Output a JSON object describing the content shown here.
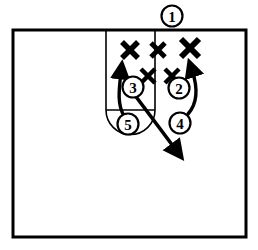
{
  "diagram": {
    "type": "half-court-play",
    "ink_color": "#000000",
    "court_color": "#ffffff",
    "court": {
      "name": "half-court",
      "outer": {
        "x": 13,
        "y": 30,
        "w": 233,
        "h": 207
      },
      "lane": {
        "left_x": 106,
        "right_x": 155,
        "top_y": 30,
        "bottom_y": 110
      },
      "free_throw_line": {
        "x1": 106,
        "y1": 110,
        "x2": 155,
        "y2": 110
      },
      "free_throw_circle": {
        "cx": 130,
        "cy": 110,
        "r": 25,
        "half": "lower"
      }
    },
    "defenders": [
      {
        "name": "defender-x-1",
        "mark": "X",
        "x": 130,
        "y": 50,
        "size": 20
      },
      {
        "name": "defender-x-2",
        "mark": "X",
        "x": 158,
        "y": 50,
        "size": 18
      },
      {
        "name": "defender-x-3",
        "mark": "X",
        "x": 190,
        "y": 48,
        "size": 22
      },
      {
        "name": "defender-x-4",
        "mark": "X",
        "x": 148,
        "y": 76,
        "size": 17
      },
      {
        "name": "defender-x-5",
        "mark": "X",
        "x": 172,
        "y": 76,
        "size": 17
      }
    ],
    "players": [
      {
        "name": "player-1",
        "label": "1",
        "x": 172,
        "y": 16,
        "r": 11
      },
      {
        "name": "player-2",
        "label": "2",
        "x": 179,
        "y": 88,
        "r": 11
      },
      {
        "name": "player-3",
        "label": "3",
        "x": 133,
        "y": 87,
        "r": 11
      },
      {
        "name": "player-4",
        "label": "4",
        "x": 180,
        "y": 123,
        "r": 11
      },
      {
        "name": "player-5",
        "label": "5",
        "x": 128,
        "y": 124,
        "r": 11
      }
    ],
    "movements": [
      {
        "name": "cut-arrow-player-5",
        "from": "5",
        "to": "up-left-wing",
        "path": "M 124 116 C 117 104 119 90 121 72"
      },
      {
        "name": "cut-arrow-player-4",
        "from": "4",
        "to": "up-right-wing",
        "path": "M 188 114 C 196 104 197 90 192 70"
      },
      {
        "name": "cut-arrow-player-3",
        "from": "3",
        "to": "down-right-corner",
        "path": "M 134 94 L 176 150"
      }
    ]
  }
}
